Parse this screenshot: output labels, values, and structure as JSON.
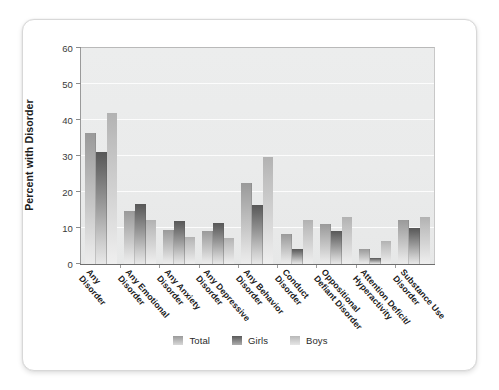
{
  "chart_data": {
    "type": "bar",
    "title": "",
    "subtitle": "",
    "xlabel": "",
    "ylabel": "Percent with Disorder",
    "ylim": [
      0,
      60
    ],
    "yticks": [
      0,
      10,
      20,
      30,
      40,
      50,
      60
    ],
    "grid": true,
    "legend_position": "bottom",
    "categories": [
      "Any Disorder",
      "Any Emotional Disorder",
      "Any Anxiety Disorder",
      "Any Depressive Disorder",
      "Any Behavior Disorder",
      "Conduct Disorder",
      "Oppositional Defiant Disorder",
      "Attention Deficit/ Hyperactivity",
      "Substance Use Disorder"
    ],
    "category_lines": [
      [
        "Any",
        "Disorder"
      ],
      [
        "Any Emotional",
        "Disorder"
      ],
      [
        "Any Anxiety",
        "Disorder"
      ],
      [
        "Any Depressive",
        "Disorder"
      ],
      [
        "Any Behavior",
        "Disorder"
      ],
      [
        "Conduct",
        "Disorder"
      ],
      [
        "Oppositional",
        "Defiant Disorder"
      ],
      [
        "Attention Deficit/",
        "Hyperactivity"
      ],
      [
        "Substance Use",
        "Disorder"
      ]
    ],
    "series": [
      {
        "name": "Total",
        "color": "#b4b4b4",
        "values": [
          36.5,
          14.7,
          9.5,
          9.3,
          22.5,
          8.3,
          11.0,
          4.2,
          12.3
        ]
      },
      {
        "name": "Girls",
        "color": "#7a7a7a",
        "values": [
          31.0,
          16.7,
          12.0,
          11.5,
          16.3,
          4.3,
          9.3,
          1.6,
          10.0
        ]
      },
      {
        "name": "Boys",
        "color": "#d2d2d2",
        "values": [
          42.0,
          12.3,
          7.5,
          7.2,
          29.8,
          12.3,
          13.0,
          6.5,
          13.0
        ]
      }
    ]
  },
  "legend": {
    "items": [
      {
        "label": "Total"
      },
      {
        "label": "Girls"
      },
      {
        "label": "Boys"
      }
    ]
  }
}
